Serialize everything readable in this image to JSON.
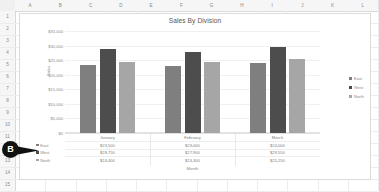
{
  "spreadsheet": {
    "columns": [
      "A",
      "B",
      "C",
      "D",
      "E",
      "F",
      "G",
      "H",
      "I",
      "J",
      "K",
      "L"
    ],
    "rows": [
      "1",
      "2",
      "3",
      "4",
      "5",
      "6",
      "7",
      "8",
      "9",
      "10",
      "11",
      "12",
      "13",
      "14",
      "15"
    ],
    "corner_label": ""
  },
  "callout": {
    "label": "B"
  },
  "chart_data": {
    "type": "bar",
    "title": "Sales By Division",
    "xlabel": "Month",
    "ylabel": "Sales",
    "categories": [
      "January",
      "February",
      "March"
    ],
    "series": [
      {
        "name": "East",
        "color": "#7f7f7f",
        "values": [
          23500,
          23000,
          24000
        ],
        "labels": [
          "$23,500",
          "$23,000",
          "$24,000"
        ]
      },
      {
        "name": "West",
        "color": "#4d4d4d",
        "values": [
          28750,
          27900,
          29550
        ],
        "labels": [
          "$28,750",
          "$27,900",
          "$29,550"
        ]
      },
      {
        "name": "North",
        "color": "#a6a6a6",
        "values": [
          24400,
          24300,
          25250
        ],
        "labels": [
          "$24,400",
          "$24,300",
          "$25,250"
        ]
      }
    ],
    "ylim": [
      0,
      35000
    ],
    "yticks": [
      35000,
      30000,
      25000,
      20000,
      15000,
      10000,
      5000,
      0
    ],
    "ytick_labels": [
      "$35,000",
      "$30,000",
      "$25,000",
      "$20,000",
      "$15,000",
      "$10,000",
      "$5,000",
      "$0"
    ],
    "grid": true,
    "legend_position": "right",
    "data_table": true
  }
}
